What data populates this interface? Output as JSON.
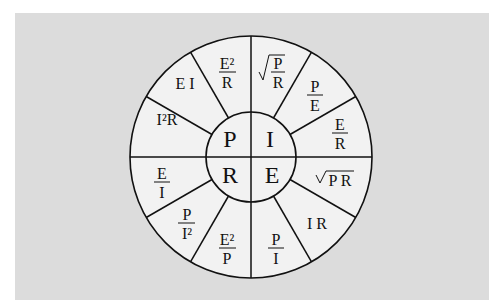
{
  "diagram": {
    "center": {
      "P": "P",
      "I": "I",
      "R": "R",
      "E": "E"
    },
    "segments": {
      "P": [
        {
          "type": "text",
          "value": "I²R"
        },
        {
          "type": "text",
          "value": "E I"
        },
        {
          "type": "fraction",
          "num": "E²",
          "den": "R"
        }
      ],
      "I": [
        {
          "type": "sqrt-fraction",
          "num": "P",
          "den": "R"
        },
        {
          "type": "fraction",
          "num": "P",
          "den": "E"
        },
        {
          "type": "fraction",
          "num": "E",
          "den": "R"
        }
      ],
      "E": [
        {
          "type": "sqrt",
          "value": "P R"
        },
        {
          "type": "text",
          "value": "I R"
        },
        {
          "type": "fraction",
          "num": "P",
          "den": "I"
        }
      ],
      "R": [
        {
          "type": "fraction",
          "num": "E²",
          "den": "P"
        },
        {
          "type": "fraction",
          "num": "P",
          "den": "I²"
        },
        {
          "type": "fraction",
          "num": "E",
          "den": "I"
        }
      ]
    },
    "colors": {
      "background": "#dcdcdc",
      "wheel": "#f2f2f2",
      "stroke": "#111111"
    }
  }
}
